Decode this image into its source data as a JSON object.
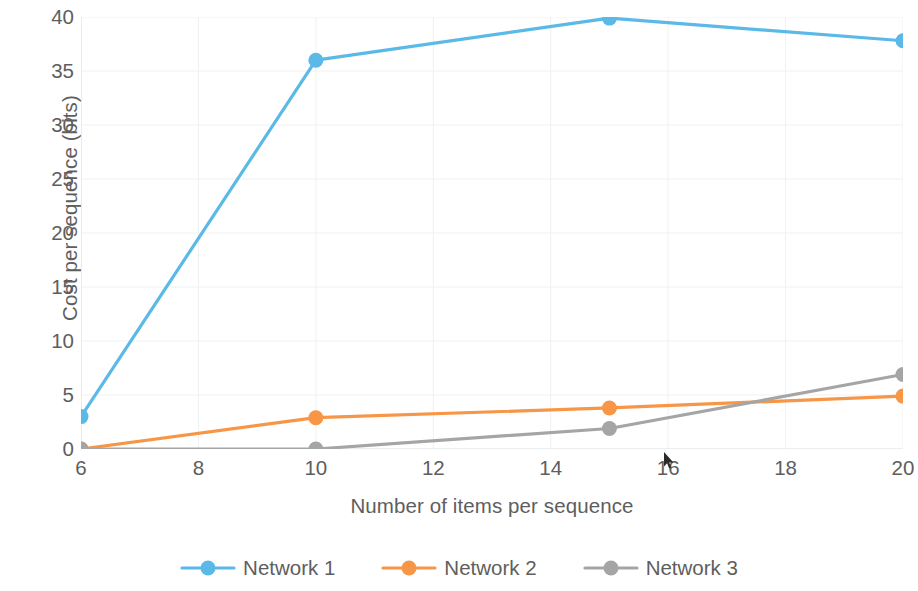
{
  "chart_data": {
    "type": "line",
    "title": "",
    "xlabel": "Number of items per sequence",
    "ylabel": "Cost per sequence (bits)",
    "x": [
      6,
      10,
      15,
      20
    ],
    "xlim": [
      6,
      20
    ],
    "ylim": [
      0,
      40
    ],
    "xticks": [
      6,
      8,
      10,
      12,
      14,
      16,
      18,
      20
    ],
    "yticks": [
      0,
      5,
      10,
      15,
      20,
      25,
      30,
      35,
      40
    ],
    "grid": true,
    "legend_position": "bottom",
    "series": [
      {
        "name": "Network 1",
        "color": "#5BB9E8",
        "marker": "circle",
        "values": [
          3.0,
          36.0,
          39.9,
          37.8
        ]
      },
      {
        "name": "Network 2",
        "color": "#F79646",
        "marker": "circle",
        "values": [
          0.0,
          2.9,
          3.8,
          4.9
        ]
      },
      {
        "name": "Network 3",
        "color": "#A5A5A5",
        "marker": "circle",
        "values": [
          0.0,
          0.0,
          1.9,
          6.9
        ]
      }
    ]
  },
  "axes": {
    "y_title": "Cost per sequence (bits)",
    "x_title": "Number of items per sequence",
    "y_tick_labels": [
      "40",
      "35",
      "30",
      "25",
      "20",
      "15",
      "10",
      "5",
      "0"
    ],
    "x_tick_labels": [
      "6",
      "8",
      "10",
      "12",
      "14",
      "16",
      "18",
      "20"
    ]
  },
  "legend": {
    "items": [
      {
        "label": "Network 1",
        "color": "#5BB9E8"
      },
      {
        "label": "Network 2",
        "color": "#F79646"
      },
      {
        "label": "Network 3",
        "color": "#A5A5A5"
      }
    ]
  },
  "cursor": {
    "icon": "mouse-pointer-icon",
    "x": 667,
    "y": 460
  }
}
